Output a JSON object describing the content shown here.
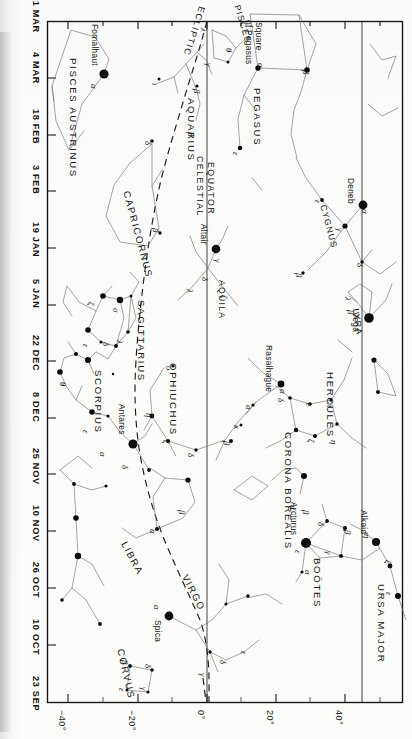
{
  "chart_data": {
    "type": "scatter",
    "xlabel": "Declination",
    "ylabel": "Date",
    "xlim": [
      -50,
      52
    ],
    "ylim": [
      0,
      12
    ],
    "grid": false,
    "legend": null,
    "x_tick_labels": [
      "−40°",
      "−20°",
      "0°",
      "20°",
      "40°"
    ],
    "x_tick_values": [
      -40,
      -20,
      0,
      20,
      40
    ],
    "y_tick_labels": [
      "21 MAR",
      "4 MAR",
      "18 FEB",
      "3 FEB",
      "19 JAN",
      "5 JAN",
      "22 DEC",
      "8 DEC",
      "25 NOV",
      "10 NOV",
      "26 OCT",
      "10 OCT",
      "23 SEP"
    ],
    "annotations": [
      "ECLIPTIC",
      "CELESTIAL EQUATOR"
    ],
    "constellations": [
      "PISCES AUSTRINUS",
      "AQUARIUS",
      "CAPRICORNUS",
      "SAGITTARIUS",
      "SCORPIUS",
      "OPHIUCHUS",
      "LIBRA",
      "VIRGO",
      "CORVUS",
      "PISCES",
      "PEGASUS",
      "CYGNUS",
      "LYRA",
      "AQUILA",
      "HERCULES",
      "CORONA BOREALIS",
      "BOÖTES",
      "URSA MAJOR"
    ],
    "named_stars": [
      "Fomalhaut",
      "Deneb",
      "Vega",
      "Altair",
      "Rasalhague",
      "Antares",
      "Arcturus",
      "Spica",
      "Alkaid"
    ]
  },
  "axes": {
    "date_axis_name": "date-axis",
    "dec_axis_name": "declination-axis",
    "dates": [
      {
        "label": "21 MAR",
        "y": 21
      },
      {
        "label": "4 MAR",
        "y": 78
      },
      {
        "label": "18 FEB",
        "y": 135
      },
      {
        "label": "3 FEB",
        "y": 191
      },
      {
        "label": "19 JAN",
        "y": 248
      },
      {
        "label": "5 JAN",
        "y": 305
      },
      {
        "label": "22 DEC",
        "y": 361
      },
      {
        "label": "8 DEC",
        "y": 418
      },
      {
        "label": "25 NOV",
        "y": 474
      },
      {
        "label": "10 NOV",
        "y": 531
      },
      {
        "label": "26 OCT",
        "y": 588
      },
      {
        "label": "10 OCT",
        "y": 645
      },
      {
        "label": "23 SEP",
        "y": 702
      }
    ],
    "declinations": [
      {
        "label": "−40°",
        "x": 68
      },
      {
        "label": "−20°",
        "x": 138
      },
      {
        "label": "0°",
        "x": 207
      },
      {
        "label": "20°",
        "x": 276
      },
      {
        "label": "40°",
        "x": 345
      }
    ]
  },
  "lines": {
    "ecliptic_label": "ECLIPTIC",
    "equator_label_1": "CELESTIAL",
    "equator_label_2": "EQUATOR"
  },
  "constellations": [
    {
      "name": "PISCES AUSTRINUS",
      "x": 78,
      "y": 58,
      "rot": 90,
      "size": "con-lbl"
    },
    {
      "name": "AQUARIUS",
      "x": 196,
      "y": 98,
      "rot": 90,
      "size": "con-lbl"
    },
    {
      "name": "CAPRICORNUS",
      "x": 131,
      "y": 190,
      "rot": 75,
      "size": "con-lbl"
    },
    {
      "name": "SAGITTARIUS",
      "x": 146,
      "y": 300,
      "rot": 90,
      "size": "con-lbl"
    },
    {
      "name": "SCORPIUS",
      "x": 103,
      "y": 370,
      "rot": 90,
      "size": "con-lbl"
    },
    {
      "name": "OPHIUCHUS",
      "x": 178,
      "y": 363,
      "rot": 90,
      "size": "con-lbl"
    },
    {
      "name": "LIBRA",
      "x": 128,
      "y": 540,
      "rot": 62,
      "size": "con-lbl"
    },
    {
      "name": "VIRGO",
      "x": 189,
      "y": 573,
      "rot": 63,
      "size": "con-lbl"
    },
    {
      "name": "CORVUS",
      "x": 125,
      "y": 648,
      "rot": 77,
      "size": "con-lbl"
    },
    {
      "name": "PISCES",
      "x": 241,
      "y": 4,
      "rot": 73,
      "size": "con-sm"
    },
    {
      "name": "PEGASUS",
      "x": 262,
      "y": 88,
      "rot": 90,
      "size": "con-lbl"
    },
    {
      "name": "CYGNUS",
      "x": 327,
      "y": 204,
      "rot": 75,
      "size": "con-sm"
    },
    {
      "name": "LYRA",
      "x": 360,
      "y": 308,
      "rot": 82,
      "size": "con-sm"
    },
    {
      "name": "AQUILA",
      "x": 226,
      "y": 280,
      "rot": 90,
      "size": "con-sm"
    },
    {
      "name": "HERCULES",
      "x": 335,
      "y": 372,
      "rot": 90,
      "size": "con-lbl"
    },
    {
      "name": "CORONA BOREALIS",
      "x": 293,
      "y": 432,
      "rot": 90,
      "size": "con-lbl"
    },
    {
      "name": "BOÖTES",
      "x": 322,
      "y": 558,
      "rot": 90,
      "size": "con-lbl"
    },
    {
      "name": "URSA MAJOR",
      "x": 386,
      "y": 584,
      "rot": 90,
      "size": "con-lbl"
    },
    {
      "name": "Square",
      "x": 263,
      "y": 22,
      "rot": 90,
      "size": "star-lbl"
    },
    {
      "name": "of Pegasus",
      "x": 253,
      "y": 20,
      "rot": 90,
      "size": "star-lbl"
    }
  ],
  "stars": [
    {
      "name": "Fomalhaut",
      "x": 104,
      "y": 74,
      "mag": 4.6,
      "lx": 99,
      "ly": 24,
      "rot": 90
    },
    {
      "name": "Deneb",
      "x": 363,
      "y": 205,
      "mag": 4.4,
      "lx": 355,
      "ly": 178,
      "rot": 90
    },
    {
      "name": "Vega",
      "x": 369,
      "y": 318,
      "mag": 4.8,
      "lx": 360,
      "ly": 312,
      "rot": 90
    },
    {
      "name": "Altair",
      "x": 216,
      "y": 249,
      "mag": 4.3,
      "lx": 208,
      "ly": 224,
      "rot": 90
    },
    {
      "name": "Rasalhague",
      "x": 281,
      "y": 384,
      "mag": 3.4,
      "lx": 273,
      "ly": 345,
      "rot": 90
    },
    {
      "name": "Antares",
      "x": 133,
      "y": 444,
      "mag": 4.6,
      "lx": 126,
      "ly": 404,
      "rot": 90
    },
    {
      "name": "Arcturus",
      "x": 306,
      "y": 543,
      "mag": 5.0,
      "lx": 298,
      "ly": 502,
      "rot": 90
    },
    {
      "name": "Spica",
      "x": 169,
      "y": 616,
      "mag": 4.4,
      "lx": 162,
      "ly": 620,
      "rot": 90
    },
    {
      "name": "Alkaid",
      "x": 376,
      "y": 542,
      "mag": 4.0,
      "lx": 368,
      "ly": 510,
      "rot": 90
    }
  ],
  "greek_labels": [
    {
      "g": "α",
      "x": 98,
      "y": 84
    },
    {
      "g": "β",
      "x": 201,
      "y": 89
    },
    {
      "g": "ι",
      "x": 159,
      "y": 83
    },
    {
      "g": "δ",
      "x": 152,
      "y": 141
    },
    {
      "g": "β",
      "x": 195,
      "y": 132
    },
    {
      "g": "β",
      "x": 160,
      "y": 228
    },
    {
      "g": "ζ",
      "x": 95,
      "y": 302
    },
    {
      "g": "σ",
      "x": 120,
      "y": 308
    },
    {
      "g": "ε",
      "x": 90,
      "y": 344
    },
    {
      "g": "δ",
      "x": 110,
      "y": 342
    },
    {
      "g": "λ",
      "x": 124,
      "y": 340
    },
    {
      "g": "λ",
      "x": 194,
      "y": 289
    },
    {
      "g": "θ",
      "x": 67,
      "y": 382
    },
    {
      "g": "ε",
      "x": 90,
      "y": 430
    },
    {
      "g": "α",
      "x": 107,
      "y": 452
    },
    {
      "g": "δ",
      "x": 129,
      "y": 465
    },
    {
      "g": "υ",
      "x": 173,
      "y": 366
    },
    {
      "g": "η",
      "x": 153,
      "y": 413
    },
    {
      "g": "ζ",
      "x": 170,
      "y": 440
    },
    {
      "g": "δ",
      "x": 195,
      "y": 453
    },
    {
      "g": "α",
      "x": 287,
      "y": 389
    },
    {
      "g": "α",
      "x": 253,
      "y": 405
    },
    {
      "g": "κ",
      "x": 241,
      "y": 425
    },
    {
      "g": "β",
      "x": 231,
      "y": 441
    },
    {
      "g": "δ",
      "x": 285,
      "y": 398
    },
    {
      "g": "ε",
      "x": 313,
      "y": 403
    },
    {
      "g": "π",
      "x": 334,
      "y": 403
    },
    {
      "g": "ζ",
      "x": 315,
      "y": 439
    },
    {
      "g": "η",
      "x": 338,
      "y": 440
    },
    {
      "g": "α",
      "x": 297,
      "y": 505
    },
    {
      "g": "β",
      "x": 310,
      "y": 510
    },
    {
      "g": "δ",
      "x": 325,
      "y": 522
    },
    {
      "g": "β",
      "x": 352,
      "y": 530
    },
    {
      "g": "γ",
      "x": 333,
      "y": 551
    },
    {
      "g": "ε",
      "x": 302,
      "y": 550
    },
    {
      "g": "α",
      "x": 312,
      "y": 570
    },
    {
      "g": "α",
      "x": 157,
      "y": 529
    },
    {
      "g": "β",
      "x": 186,
      "y": 510
    },
    {
      "g": "α",
      "x": 161,
      "y": 605
    },
    {
      "g": "β",
      "x": 129,
      "y": 660
    },
    {
      "g": "δ",
      "x": 152,
      "y": 664
    },
    {
      "g": "γ",
      "x": 148,
      "y": 687
    },
    {
      "g": "ε",
      "x": 126,
      "y": 688
    },
    {
      "g": "γ",
      "x": 207,
      "y": 673
    },
    {
      "g": "δ",
      "x": 227,
      "y": 660
    },
    {
      "g": "ε",
      "x": 248,
      "y": 651
    },
    {
      "g": "α",
      "x": 265,
      "y": 63
    },
    {
      "g": "β",
      "x": 310,
      "y": 70
    },
    {
      "g": "ε",
      "x": 240,
      "y": 152
    },
    {
      "g": "λ",
      "x": 208,
      "y": 28
    },
    {
      "g": "θ",
      "x": 233,
      "y": 48
    },
    {
      "g": "γ",
      "x": 213,
      "y": 63
    },
    {
      "g": "α",
      "x": 369,
      "y": 209
    },
    {
      "g": "γ",
      "x": 344,
      "y": 228
    },
    {
      "g": "ε",
      "x": 322,
      "y": 200
    },
    {
      "g": "β",
      "x": 303,
      "y": 273
    },
    {
      "g": "δ",
      "x": 364,
      "y": 263
    },
    {
      "g": "λ",
      "x": 352,
      "y": 297
    },
    {
      "g": "β",
      "x": 355,
      "y": 310
    },
    {
      "g": "α",
      "x": 222,
      "y": 246
    },
    {
      "g": "γ",
      "x": 222,
      "y": 259
    },
    {
      "g": "δ",
      "x": 209,
      "y": 277
    },
    {
      "g": "ζ",
      "x": 228,
      "y": 295
    },
    {
      "g": "η",
      "x": 371,
      "y": 534
    },
    {
      "g": "ζ",
      "x": 392,
      "y": 560
    },
    {
      "g": "ε",
      "x": 393,
      "y": 592
    }
  ]
}
